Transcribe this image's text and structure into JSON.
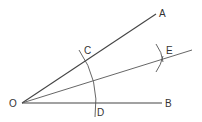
{
  "diagram": {
    "stroke_color": "#444444",
    "points": {
      "O": {
        "label": "O",
        "x": 22,
        "y": 103
      },
      "A": {
        "label": "A",
        "x": 156,
        "y": 14
      },
      "B": {
        "label": "B",
        "x": 162,
        "y": 103
      },
      "C": {
        "label": "C"
      },
      "D": {
        "label": "D"
      },
      "E": {
        "label": "E"
      }
    },
    "segments": [
      "OA",
      "OB",
      "OE"
    ],
    "arcs": [
      "arc CD centered at O",
      "arc marks crossing at E"
    ]
  }
}
